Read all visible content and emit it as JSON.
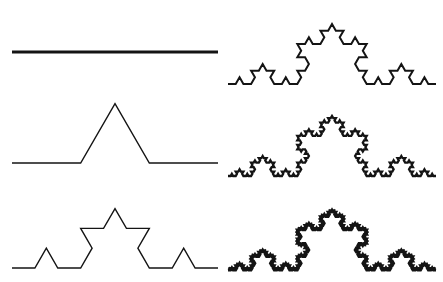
{
  "figure": {
    "background_color": "#ffffff",
    "stroke_color": "#141414",
    "width": 443,
    "height": 282,
    "panel_count": 6
  },
  "chart_data": {
    "type": "line",
    "subtitle": "",
    "xlabel": "",
    "ylabel": "",
    "grid": false,
    "legend": "none",
    "xlim": [
      0,
      443
    ],
    "ylim": [
      282,
      0
    ],
    "series": [
      {
        "name": "iteration-0",
        "iteration": 0,
        "segments": 1,
        "column": "left",
        "row": 1,
        "start": [
          12,
          52
        ],
        "end": [
          218,
          52
        ],
        "length": 206,
        "baseline_y": 52,
        "stroke_width": 3.2
      },
      {
        "name": "iteration-1",
        "iteration": 1,
        "segments": 4,
        "column": "left",
        "row": 2,
        "start": [
          12,
          163
        ],
        "end": [
          218,
          163
        ],
        "length": 206,
        "baseline_y": 163,
        "stroke_width": 1.4
      },
      {
        "name": "iteration-2",
        "iteration": 2,
        "segments": 16,
        "column": "left",
        "row": 3,
        "start": [
          12,
          268
        ],
        "end": [
          218,
          268
        ],
        "length": 206,
        "baseline_y": 268,
        "stroke_width": 1.4
      },
      {
        "name": "iteration-3",
        "iteration": 3,
        "segments": 64,
        "column": "right",
        "row": 1,
        "start": [
          228,
          84
        ],
        "end": [
          436,
          84
        ],
        "length": 208,
        "baseline_y": 84,
        "stroke_width": 2.0
      },
      {
        "name": "iteration-4",
        "iteration": 4,
        "segments": 256,
        "column": "right",
        "row": 2,
        "start": [
          228,
          176
        ],
        "end": [
          436,
          176
        ],
        "length": 208,
        "baseline_y": 176,
        "stroke_width": 2.3
      },
      {
        "name": "iteration-5",
        "iteration": 5,
        "segments": 1024,
        "column": "right",
        "row": 3,
        "start": [
          228,
          270
        ],
        "end": [
          436,
          270
        ],
        "length": 208,
        "baseline_y": 270,
        "stroke_width": 2.8
      }
    ]
  }
}
